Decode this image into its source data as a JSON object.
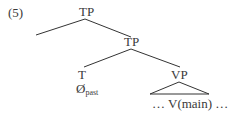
{
  "example_number": "(5)",
  "tree": {
    "root": {
      "label": "TP"
    },
    "inner_tp": {
      "label": "TP"
    },
    "t_head": {
      "label": "T",
      "content_base": "Ø",
      "content_sub": "past"
    },
    "vp": {
      "label": "VP",
      "content": "… V(main) …"
    }
  },
  "colors": {
    "text": "#3a3a3a",
    "lines": "#333333"
  }
}
